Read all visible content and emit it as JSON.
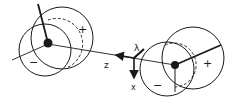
{
  "diagram": {
    "colors": {
      "ink": "#1a1a1a",
      "background": "#ffffff"
    },
    "left_group": {
      "plus_label": "+",
      "minus_label": "−"
    },
    "right_group": {
      "plus_label": "+",
      "minus_label": "−"
    },
    "axes": {
      "z_label": "z",
      "x_label": "x",
      "lambda_label": "λ"
    }
  }
}
